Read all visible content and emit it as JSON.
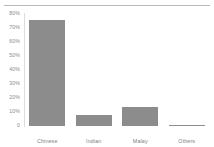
{
  "chart_data": {
    "type": "bar",
    "title": "",
    "subtitle": "",
    "xlabel": "",
    "ylabel": "",
    "categories": [
      "Chinese",
      "Indian",
      "Malay",
      "Others"
    ],
    "values": [
      75.5,
      8.0,
      13.5,
      1.0
    ],
    "series": [
      {
        "name": "Share of population",
        "values": [
          75.5,
          8.0,
          13.5,
          1.0
        ]
      }
    ],
    "ylim": [
      0,
      80
    ],
    "ytick_values": [
      0,
      10,
      20,
      30,
      40,
      50,
      60,
      70,
      80
    ],
    "ytick_labels": [
      "0",
      "10%",
      "20%",
      "30%",
      "40%",
      "50%",
      "60%",
      "70%",
      "80%"
    ],
    "xtick_labels": [
      "Chinese",
      "Indian",
      "Malay",
      "Others"
    ],
    "grid": false,
    "legend": false,
    "legend_position": "none",
    "annotations": [],
    "colors": {
      "bar_fill": "#8c8c8c",
      "axis_line": "#dcdcdc",
      "top_rule": "#b9b9b9",
      "tick_label": "#8a8a8a",
      "category_label": "#7f7f7f",
      "background": "#ffffff"
    }
  }
}
